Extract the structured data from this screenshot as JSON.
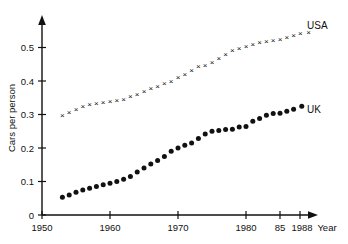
{
  "chart_data": {
    "type": "scatter",
    "title": "",
    "xlabel": "Year",
    "ylabel": "Cars per person",
    "xlim": [
      1950,
      1990
    ],
    "ylim": [
      0,
      0.565
    ],
    "grid": false,
    "legend_position": "right-of-series-end",
    "x_tick_labels": [
      "1950",
      "1960",
      "1970",
      "1980",
      "85",
      "1988"
    ],
    "x_tick_values": [
      1950,
      1960,
      1970,
      1980,
      1985,
      1988
    ],
    "y_tick_labels": [
      "0",
      "0.1",
      "0.2",
      "0.3",
      "0.4",
      "0.5"
    ],
    "y_tick_values": [
      0,
      0.1,
      0.2,
      0.3,
      0.4,
      0.5
    ],
    "x": [
      1953,
      1954,
      1955,
      1956,
      1957,
      1958,
      1959,
      1960,
      1961,
      1962,
      1963,
      1964,
      1965,
      1966,
      1967,
      1968,
      1969,
      1970,
      1971,
      1972,
      1973,
      1974,
      1975,
      1976,
      1977,
      1978,
      1979,
      1980,
      1981,
      1982,
      1983,
      1984,
      1985,
      1986,
      1987
    ],
    "series": [
      {
        "name": "USA",
        "marker": "x",
        "label": "USA",
        "values": [
          0.295,
          0.305,
          0.315,
          0.322,
          0.328,
          0.331,
          0.334,
          0.339,
          0.341,
          0.345,
          0.352,
          0.36,
          0.367,
          0.375,
          0.382,
          0.39,
          0.398,
          0.408,
          0.418,
          0.43,
          0.441,
          0.445,
          0.455,
          0.467,
          0.478,
          0.49,
          0.497,
          0.503,
          0.508,
          0.513,
          0.518,
          0.521,
          0.524,
          0.53,
          0.535
        ]
      },
      {
        "name": "UK",
        "marker": "circle",
        "label": "UK",
        "values": [
          0.053,
          0.06,
          0.068,
          0.075,
          0.08,
          0.085,
          0.09,
          0.095,
          0.1,
          0.107,
          0.115,
          0.128,
          0.14,
          0.152,
          0.163,
          0.175,
          0.19,
          0.2,
          0.208,
          0.215,
          0.228,
          0.242,
          0.25,
          0.252,
          0.255,
          0.256,
          0.263,
          0.264,
          0.28,
          0.288,
          0.298,
          0.303,
          0.304,
          0.31,
          0.316
        ]
      }
    ],
    "usa_trailing_points": [
      0.54,
      0.545
    ],
    "uk_trailing_point": 0.325
  },
  "labels": {
    "y_axis_title": "Cars per person",
    "x_axis_title": "Year",
    "usa_series_label": "USA",
    "uk_series_label": "UK"
  }
}
